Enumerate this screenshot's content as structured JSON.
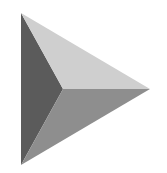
{
  "icon": {
    "semantic": "play-triangle-icon",
    "label": "Play",
    "colors": {
      "background": "#ffffff",
      "left_face": "#5b5b5b",
      "top_face": "#cfcfcf",
      "bottom_face": "#8e8e8e"
    }
  }
}
